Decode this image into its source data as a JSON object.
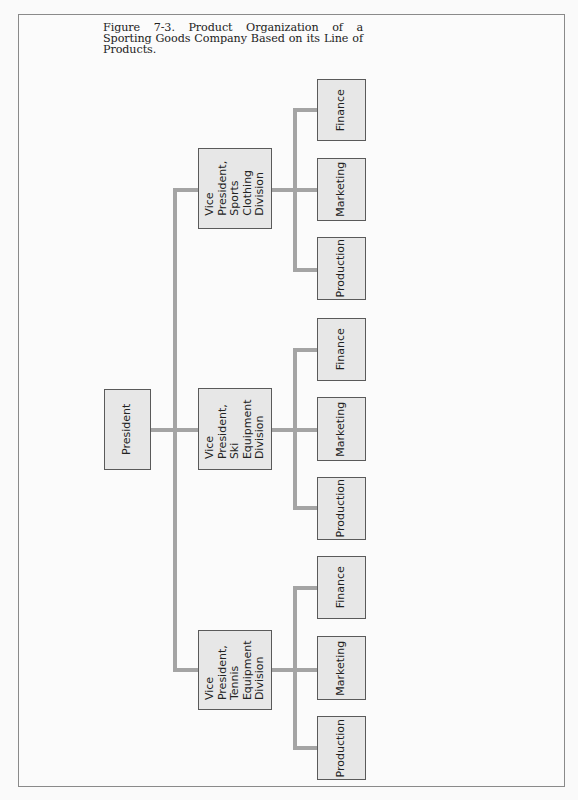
{
  "caption": "Figure 7-3. Product Organization of a Sporting Goods Company Based on its Line of Products.",
  "colors": {
    "box_fill": "#e7e7e7",
    "box_border": "#5a5a5a",
    "connector": "#a4a4a4",
    "frame_border": "#8a8a8a"
  },
  "president": {
    "label": "President"
  },
  "divisions": [
    {
      "label": "Vice\nPresident,\nSports\nClothing\nDivision",
      "departments": [
        {
          "label": "Finance"
        },
        {
          "label": "Marketing"
        },
        {
          "label": "Production"
        }
      ]
    },
    {
      "label": "Vice\nPresident,\nSki\nEquipment\nDivision",
      "departments": [
        {
          "label": "Finance"
        },
        {
          "label": "Marketing"
        },
        {
          "label": "Production"
        }
      ]
    },
    {
      "label": "Vice\nPresident,\nTennis\nEquipment\nDivision",
      "departments": [
        {
          "label": "Finance"
        },
        {
          "label": "Marketing"
        },
        {
          "label": "Production"
        }
      ]
    }
  ]
}
